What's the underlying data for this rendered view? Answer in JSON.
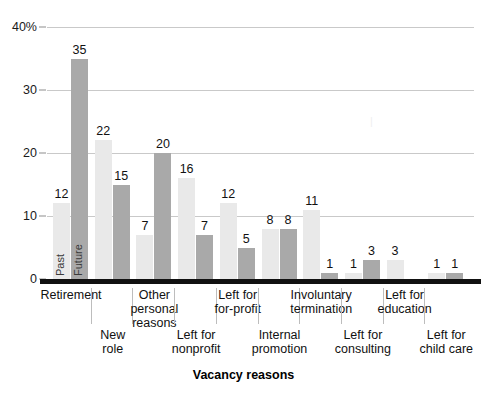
{
  "chart_data": {
    "type": "bar",
    "title": "",
    "subtitle": "",
    "xlabel": "Vacancy reasons",
    "ylabel": "",
    "ylim": [
      0,
      40
    ],
    "grid": true,
    "legend_position": "in-bars",
    "y_ticks": [
      "0",
      "10",
      "20",
      "30",
      "40%"
    ],
    "y_tick_values": [
      0,
      10,
      20,
      30,
      40
    ],
    "categories": [
      "Retirement",
      "New role",
      "Other personal reasons",
      "Left for nonprofit",
      "Left for for-profit",
      "Internal promotion",
      "Involuntary termination",
      "Left for consulting",
      "Left for education",
      "Left for child care"
    ],
    "category_lines": [
      [
        "Retirement"
      ],
      [
        "New",
        "role"
      ],
      [
        "Other",
        "personal",
        "reasons"
      ],
      [
        "Left for",
        "nonprofit"
      ],
      [
        "Left for",
        "for-profit"
      ],
      [
        "Internal",
        "promotion"
      ],
      [
        "Involuntary",
        "termination"
      ],
      [
        "Left for",
        "consulting"
      ],
      [
        "Left for",
        "education"
      ],
      [
        "Left for",
        "child care"
      ]
    ],
    "series": [
      {
        "name": "Past",
        "color": "#e9e9e9",
        "values": [
          12,
          22,
          7,
          16,
          12,
          8,
          11,
          1,
          3,
          1
        ]
      },
      {
        "name": "Future",
        "color": "#a9a9a9",
        "values": [
          35,
          15,
          20,
          7,
          5,
          8,
          1,
          3,
          null,
          1
        ]
      }
    ],
    "bar_labels": {
      "past": [
        "12",
        "22",
        "7",
        "16",
        "12",
        "8",
        "11",
        "1",
        "3",
        "1"
      ],
      "future": [
        "35",
        "15",
        "20",
        "7",
        "5",
        "8",
        "1",
        "3",
        "",
        "1"
      ]
    },
    "in_bar_labels": [
      "Past",
      "Future"
    ]
  },
  "colors": {
    "past_bar": "#e9e9e9",
    "future_bar": "#a9a9a9",
    "gridline": "#c9c9c9",
    "baseline": "#111111",
    "text": "#111111",
    "separator": "#bdbdbd",
    "background": "#ffffff"
  }
}
